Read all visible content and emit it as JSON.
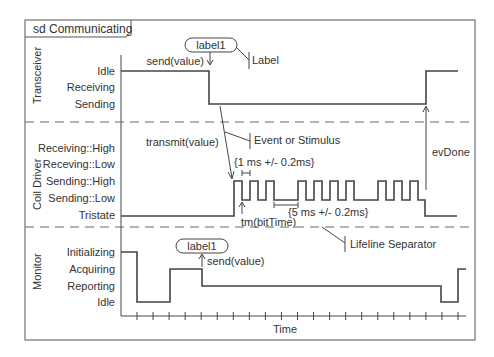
{
  "frame": {
    "title": "sd Communicating"
  },
  "lifelines": [
    {
      "name": "Transceiver",
      "states": [
        "Idle",
        "Receiving",
        "Sending"
      ]
    },
    {
      "name": "Coil Driver",
      "states": [
        "Receiving::High",
        "Receving::Low",
        "Sending::High",
        "Sending::Low",
        "Tristate"
      ]
    },
    {
      "name": "Monitor",
      "states": [
        "Initializing",
        "Acquiring",
        "Reporting",
        "Idle"
      ]
    }
  ],
  "annotations": {
    "label_pill_top": "label1",
    "send_top": "send(value)",
    "label_callout": "Label",
    "transmit": "transmit(value)",
    "event_callout": "Event or Stimulus",
    "constraint_1ms": "{1 ms +/- 0.2ms}",
    "constraint_5ms": "{5 ms +/- 0.2ms}",
    "tm_bittime": "tm(bitTime)",
    "evdone": "evDone",
    "separator_callout": "Lifeline Separator",
    "label_pill_bottom": "label1",
    "send_bottom": "send(value)"
  },
  "axis": {
    "label": "Time",
    "tick_count": 21
  },
  "timelines": {
    "transceiver": [
      {
        "state": "Idle",
        "until_tick": 5.5
      },
      {
        "state": "Sending",
        "until_tick": 19.3
      },
      {
        "state": "Idle",
        "until_tick": 21.3
      }
    ],
    "monitor": [
      {
        "state": "Initializing",
        "until_tick": 1
      },
      {
        "state": "Idle",
        "until_tick": 3
      },
      {
        "state": "Acquiring",
        "until_tick": 5
      },
      {
        "state": "Reporting",
        "until_tick": 20
      },
      {
        "state": "Idle",
        "until_tick": 21
      },
      {
        "state": "Acquiring",
        "until_tick": 21.5
      }
    ]
  },
  "colors": {
    "line": "#444444",
    "frame": "#555555",
    "text": "#333333"
  }
}
